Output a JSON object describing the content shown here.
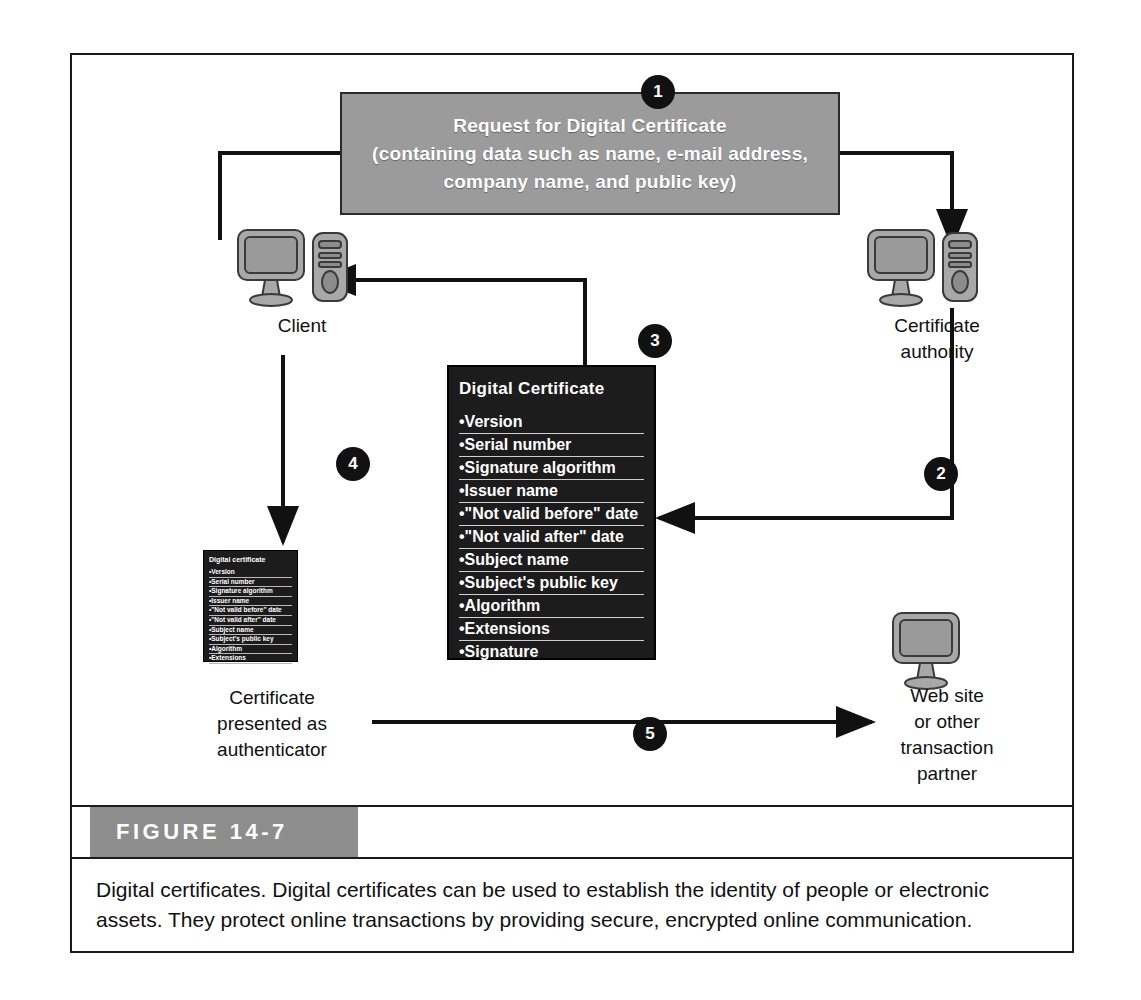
{
  "figure": {
    "tab_label": "FIGURE 14-7",
    "caption": "Digital certificates. Digital certificates can be used to establish the identity of people or electronic assets. They protect online transactions by providing secure, encrypted online communication."
  },
  "request_box": {
    "line1": "Request for Digital Certificate",
    "line2": "(containing data such as name, e-mail address,",
    "line3": "company name, and public key)",
    "background_color": "#9b9b9b",
    "text_color": "#ffffff"
  },
  "steps": [
    {
      "number": "1"
    },
    {
      "number": "2"
    },
    {
      "number": "3"
    },
    {
      "number": "4"
    },
    {
      "number": "5"
    }
  ],
  "nodes": {
    "client": {
      "label": "Client",
      "icon": "desktop-computer-icon"
    },
    "certificate_authority": {
      "label_line1": "Certificate",
      "label_line2": "authority",
      "icon": "desktop-computer-icon"
    },
    "website": {
      "label_line1": "Web site",
      "label_line2": "or other",
      "label_line3": "transaction",
      "label_line4": "partner",
      "icon": "monitor-icon"
    },
    "presented_certificate": {
      "label_line1": "Certificate",
      "label_line2": "presented as",
      "label_line3": "authenticator"
    }
  },
  "certificate": {
    "title": "Digital Certificate",
    "title_small": "Digital certificate",
    "background_color": "#1c1c1c",
    "text_color": "#ffffff",
    "fields": [
      "•Version",
      "•Serial number",
      "•Signature algorithm",
      "•Issuer name",
      "•\"Not valid before\" date",
      "•\"Not valid after\" date",
      "•Subject name",
      "•Subject's public key",
      "•Algorithm",
      "•Extensions",
      "•Signature"
    ]
  }
}
